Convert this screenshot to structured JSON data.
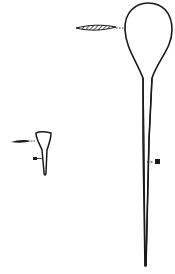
{
  "figure": {
    "type": "specimen-illustration",
    "background": "#ffffff",
    "stroke_color": "#1a1a1a",
    "elements": [
      {
        "name": "large-flask-specimen",
        "description": "Large specimen with round bulb and long tapering stalk"
      },
      {
        "name": "large-specimen-pointer",
        "description": "Hatched spindle-shaped pointer marking bulb"
      },
      {
        "name": "large-specimen-marker",
        "description": "Square marker with dashed leader on stalk"
      },
      {
        "name": "small-flask-specimen",
        "description": "Small funnel-shaped specimen"
      },
      {
        "name": "small-specimen-pointer",
        "description": "Spindle pointer marking top of small specimen"
      },
      {
        "name": "small-specimen-marker",
        "description": "Square marker on small specimen stalk"
      }
    ]
  }
}
